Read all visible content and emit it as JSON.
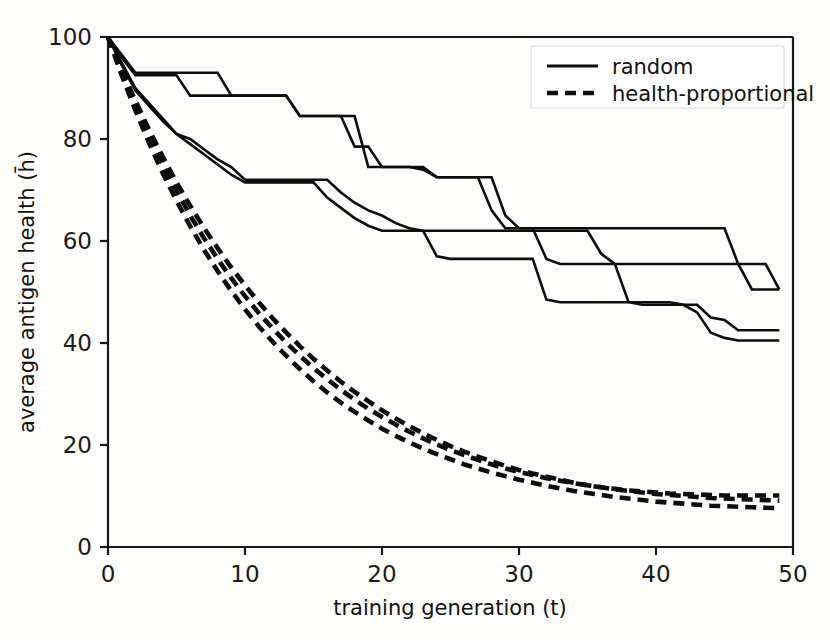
{
  "chart_data": {
    "type": "line",
    "title": "",
    "xlabel": "training generation (t)",
    "ylabel": "average antigen health (h̄)",
    "xlim": [
      0,
      50
    ],
    "ylim": [
      0,
      100
    ],
    "xticks": [
      0,
      10,
      20,
      30,
      40,
      50
    ],
    "yticks": [
      0,
      20,
      40,
      60,
      80,
      100
    ],
    "xtick_labels": [
      "0",
      "10",
      "20",
      "30",
      "40",
      "50"
    ],
    "ytick_labels": [
      "0",
      "20",
      "40",
      "60",
      "80",
      "100"
    ],
    "grid": false,
    "legend_position": "upper right",
    "legend": [
      {
        "label": "random",
        "style": "solid"
      },
      {
        "label": "health-proportional",
        "style": "dashed"
      }
    ],
    "x": [
      0,
      1,
      2,
      3,
      4,
      5,
      6,
      7,
      8,
      9,
      10,
      11,
      12,
      13,
      14,
      15,
      16,
      17,
      18,
      19,
      20,
      21,
      22,
      23,
      24,
      25,
      26,
      27,
      28,
      29,
      30,
      31,
      32,
      33,
      34,
      35,
      36,
      37,
      38,
      39,
      40,
      41,
      42,
      43,
      44,
      45,
      46,
      47,
      48,
      49
    ],
    "series": [
      {
        "name": "random-run-1",
        "style": "solid",
        "values": [
          100,
          96.5,
          93,
          93,
          93,
          93,
          93,
          93,
          93,
          88.5,
          88.5,
          88.5,
          88.5,
          88.5,
          84.5,
          84.5,
          84.5,
          84.5,
          84.5,
          74.5,
          74.5,
          74.5,
          74.5,
          74.5,
          72.5,
          72.5,
          72.5,
          72.5,
          72.5,
          65,
          62.5,
          62.5,
          62.5,
          62.5,
          62.5,
          62.5,
          62.5,
          62.5,
          62.5,
          62.5,
          62.5,
          62.5,
          62.5,
          62.5,
          62.5,
          62.5,
          55.5,
          50.5,
          50.5,
          50.5
        ]
      },
      {
        "name": "random-run-2",
        "style": "solid",
        "values": [
          100,
          96,
          92.5,
          92.5,
          92.5,
          92.5,
          88.5,
          88.5,
          88.5,
          88.5,
          88.5,
          88.5,
          88.5,
          88.5,
          84.5,
          84.5,
          84.5,
          84.5,
          78.5,
          78.5,
          74.5,
          74.5,
          74.5,
          74,
          72.5,
          72.5,
          72.5,
          72.5,
          66,
          62.5,
          62.5,
          62.5,
          56.5,
          55.5,
          55.5,
          55.5,
          55.5,
          55.5,
          55.5,
          55.5,
          55.5,
          55.5,
          55.5,
          55.5,
          55.5,
          55.5,
          55.5,
          55.5,
          55.5,
          50.5
        ]
      },
      {
        "name": "random-run-3",
        "style": "solid",
        "values": [
          100,
          95,
          90,
          87,
          84,
          81,
          80,
          78,
          76,
          74.5,
          72,
          72,
          72,
          72,
          72,
          72,
          72,
          69.5,
          67.5,
          66,
          65,
          63.5,
          62.5,
          62,
          62,
          62,
          62,
          62,
          62,
          62,
          62,
          62,
          62,
          62,
          62,
          62,
          57.5,
          55.5,
          48,
          47.5,
          47.5,
          47.5,
          47.5,
          47.5,
          45,
          44.5,
          42.5,
          42.5,
          42.5,
          42.5
        ]
      },
      {
        "name": "random-run-4",
        "style": "solid",
        "values": [
          100,
          94.5,
          89.5,
          86.5,
          83.5,
          81,
          79,
          77,
          75,
          73,
          71.5,
          71.5,
          71.5,
          71.5,
          71.5,
          71.5,
          68.5,
          66.5,
          64.5,
          63,
          62,
          62,
          62,
          62,
          57,
          56.5,
          56.5,
          56.5,
          56.5,
          56.5,
          56.5,
          56.5,
          48.5,
          48,
          48,
          48,
          48,
          48,
          48,
          48,
          48,
          48,
          47.5,
          46,
          42,
          41,
          40.5,
          40.5,
          40.5,
          40.5
        ]
      },
      {
        "name": "health-proportional-run-1",
        "style": "dashed",
        "values": [
          100,
          93.5,
          87.5,
          81.8,
          76.5,
          71.5,
          66.9,
          62.6,
          58.6,
          54.8,
          51.3,
          48.0,
          44.9,
          42.1,
          39.4,
          36.9,
          34.6,
          32.4,
          30.4,
          28.6,
          26.8,
          25.2,
          23.7,
          22.3,
          21.0,
          19.8,
          18.7,
          17.7,
          16.8,
          15.9,
          15.1,
          14.4,
          13.8,
          13.2,
          12.6,
          12.1,
          11.7,
          11.3,
          11.0,
          10.7,
          10.4,
          10.2,
          10.0,
          9.8,
          9.6,
          9.5,
          9.4,
          9.3,
          9.2,
          9.1
        ]
      },
      {
        "name": "health-proportional-run-2",
        "style": "dashed",
        "values": [
          100,
          93.0,
          86.6,
          80.6,
          75.0,
          69.8,
          65.0,
          60.6,
          56.5,
          52.7,
          49.2,
          45.9,
          42.9,
          40.1,
          37.5,
          35.1,
          32.9,
          30.8,
          28.9,
          27.1,
          25.5,
          24.0,
          22.6,
          21.3,
          20.1,
          19.0,
          18.0,
          17.1,
          16.2,
          15.4,
          14.7,
          14.1,
          13.5,
          13.0,
          12.5,
          12.1,
          11.7,
          11.4,
          11.1,
          10.9,
          10.7,
          10.5,
          10.4,
          10.3,
          10.2,
          10.1,
          10.1,
          10.1,
          10.1,
          10.1
        ]
      },
      {
        "name": "health-proportional-run-3",
        "style": "dashed",
        "values": [
          100,
          92.5,
          85.6,
          79.2,
          73.3,
          67.9,
          62.9,
          58.3,
          54.1,
          50.2,
          46.6,
          43.3,
          40.3,
          37.5,
          34.9,
          32.5,
          30.3,
          28.3,
          26.5,
          24.8,
          23.2,
          21.8,
          20.5,
          19.3,
          18.2,
          17.2,
          16.2,
          15.4,
          14.6,
          13.9,
          13.2,
          12.6,
          12.0,
          11.5,
          11.0,
          10.6,
          10.2,
          9.8,
          9.5,
          9.2,
          8.9,
          8.7,
          8.5,
          8.3,
          8.1,
          8.0,
          7.9,
          7.8,
          7.7,
          7.6
        ]
      }
    ]
  },
  "axes": {
    "xlabel": "training generation (t)",
    "ylabel_prefix": "average antigen health (",
    "ylabel_symbol": "h̄",
    "ylabel_suffix": ")"
  },
  "legend": {
    "entry_random": "random",
    "entry_health_proportional": "health-proportional"
  },
  "colors": {
    "line": "#0d0d0d",
    "axis": "#1a1a1a",
    "background": "#fdfdfc",
    "legend_border": "#d8d8d8"
  }
}
